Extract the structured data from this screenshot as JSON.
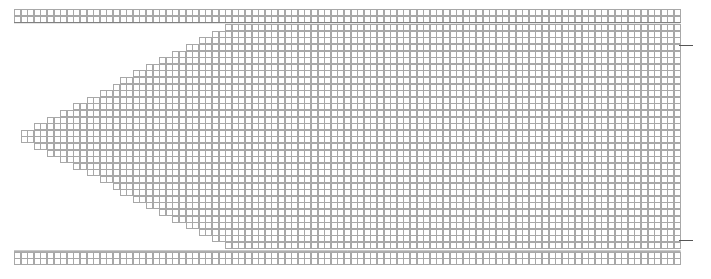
{
  "figure": {
    "type": "grid-matrix",
    "width_px": 711,
    "height_px": 279
  },
  "chart_data": {
    "type": "heatmap",
    "subtitle": "",
    "xlabel": "",
    "ylabel": "",
    "grid": true,
    "legend": "none",
    "colormap": "grayscale",
    "value_range": [
      0,
      1
    ],
    "note": "Each cell is drawn as a white square with a light border and a centered filled marker whose gray level encodes the cell value; empty cells encode zero.",
    "columns": 101,
    "rows": 38,
    "cell_pitch_px": 6.6,
    "marker_size_px": 3,
    "x": [],
    "xtick_labels": [],
    "ytick_labels": [],
    "series": []
  },
  "layout": {
    "origin_x": 14,
    "origin_y": 9,
    "cell": 6.6,
    "cols": 101,
    "rows": 38,
    "header_rows": 2,
    "footer_rows": 2,
    "body_gap_top_px": 2,
    "body_gap_bottom_px": 3,
    "wedge": {
      "enabled": true,
      "apex_x_px": 17,
      "apex_row_from": 18,
      "apex_row_to": 21,
      "top_indent_cols": 32,
      "bottom_indent_cols": 32,
      "description": "Left-pointing triangular notch: body rows are indented from the left, deepest indent at the top and bottom body rows, reaching the apex at mid height."
    },
    "right_ticks": [
      {
        "y_px": 45,
        "length_px": 14
      },
      {
        "y_px": 240,
        "length_px": 14
      }
    ]
  },
  "palette": {
    "page_background": "#ffffff",
    "cell_background": "#ffffff",
    "cell_border": "#a8a8a8",
    "marker_dark": "#000000",
    "marker_mid": "#6b6b6b",
    "marker_light": "#b4b4b4",
    "strip_border": "#777777",
    "tick_color": "#555555"
  },
  "header_strip": {
    "label": "header-row",
    "density": 0.82
  },
  "footer_strip": {
    "label": "footer-row",
    "density": 0.18
  },
  "body": {
    "label": "matrix-body",
    "density": 0.72
  }
}
